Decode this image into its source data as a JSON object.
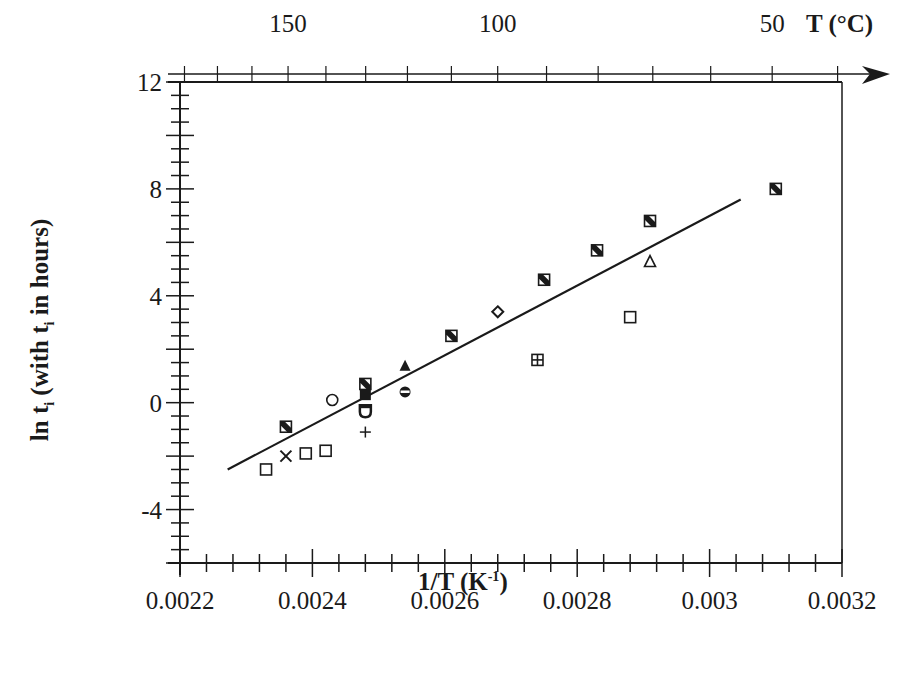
{
  "chart_data": {
    "type": "scatter",
    "title": "",
    "xlabel": "1/T  (K-1)",
    "xlabel_main": "1/T  (K",
    "xlabel_sup": "-1",
    "xlabel_close": ")",
    "ylabel": "ln ti (with ti in hours)",
    "ylabel_parts": {
      "a": "ln t",
      "sub1": "i",
      "b": " (with t",
      "sub2": "i",
      "c": " in hours)"
    },
    "top_axis_label": "T (°C)",
    "xlim": [
      0.0022,
      0.0032
    ],
    "ylim": [
      -6,
      12
    ],
    "x_ticks": [
      "0.0022",
      "0.0024",
      "0.0026",
      "0.0028",
      "0.003",
      "0.0032"
    ],
    "x_tick_values": [
      0.0022,
      0.0024,
      0.0026,
      0.0028,
      0.003,
      0.0032
    ],
    "y_ticks": [
      "12",
      "8",
      "4",
      "0",
      "-4"
    ],
    "y_tick_values": [
      12,
      8,
      4,
      0,
      -4
    ],
    "top_ticks": [
      "150",
      "100",
      "50"
    ],
    "top_tick_values_celsius": [
      150,
      100,
      50
    ],
    "grid": false,
    "legend": null,
    "fit_line": {
      "x": [
        0.002272,
        0.003047
      ],
      "y": [
        -2.5,
        7.6
      ]
    },
    "series": [
      {
        "name": "hatched-square",
        "marker": "square-hatched",
        "points": [
          [
            0.00236,
            -0.9
          ],
          [
            0.00248,
            0.7
          ],
          [
            0.00261,
            2.5
          ],
          [
            0.00275,
            4.6
          ],
          [
            0.00283,
            5.7
          ],
          [
            0.00291,
            6.8
          ],
          [
            0.0031,
            8.0
          ]
        ]
      },
      {
        "name": "open-square",
        "marker": "square",
        "points": [
          [
            0.00233,
            -2.5
          ],
          [
            0.00239,
            -1.9
          ],
          [
            0.00242,
            -1.8
          ],
          [
            0.00288,
            3.2
          ]
        ]
      },
      {
        "name": "cross",
        "marker": "x",
        "points": [
          [
            0.00236,
            -2.0
          ]
        ]
      },
      {
        "name": "open-circle",
        "marker": "circle",
        "points": [
          [
            0.00243,
            0.1
          ]
        ]
      },
      {
        "name": "filled-square",
        "marker": "square-filled",
        "points": [
          [
            0.00248,
            0.3
          ]
        ]
      },
      {
        "name": "shield",
        "marker": "shield",
        "points": [
          [
            0.00248,
            -0.3
          ]
        ]
      },
      {
        "name": "plus",
        "marker": "plus",
        "points": [
          [
            0.00248,
            -1.1
          ]
        ]
      },
      {
        "name": "filled-triangle",
        "marker": "triangle-filled",
        "points": [
          [
            0.00254,
            1.4
          ]
        ]
      },
      {
        "name": "half-circle",
        "marker": "circle-half",
        "points": [
          [
            0.00254,
            0.4
          ]
        ]
      },
      {
        "name": "open-diamond",
        "marker": "diamond",
        "points": [
          [
            0.00268,
            3.4
          ]
        ]
      },
      {
        "name": "square-cross",
        "marker": "square-plus",
        "points": [
          [
            0.00274,
            1.6
          ]
        ]
      },
      {
        "name": "open-triangle",
        "marker": "triangle",
        "points": [
          [
            0.00291,
            5.3
          ]
        ]
      }
    ]
  },
  "colors": {
    "ink": "#1a1a1a",
    "background": "#ffffff"
  }
}
